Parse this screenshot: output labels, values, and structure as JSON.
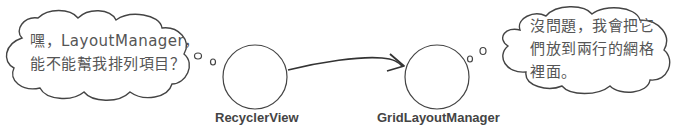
{
  "diagram": {
    "nodes": [
      {
        "id": "recycler",
        "label": "RecyclerView"
      },
      {
        "id": "grid",
        "label": "GridLayoutManager"
      }
    ],
    "edges": [
      {
        "from": "recycler",
        "to": "grid",
        "style": "hand-drawn arrow"
      }
    ],
    "bubbles": [
      {
        "speaker": "recycler",
        "lines": [
          "嘿，LayoutManager，",
          "能不能幫我排列項目？"
        ]
      },
      {
        "speaker": "grid",
        "lines": [
          "沒問題，我會把它",
          "們放到兩行的網格",
          "裡面。"
        ]
      }
    ]
  },
  "colors": {
    "stroke": "#444444",
    "text": "#555555",
    "background": "#ffffff"
  }
}
